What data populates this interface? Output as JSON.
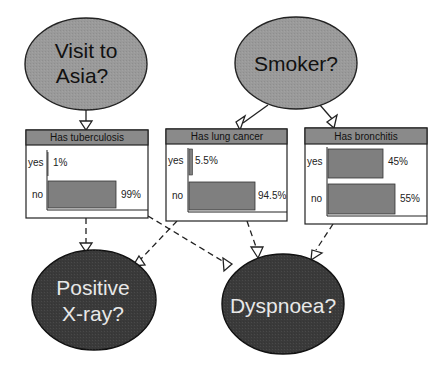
{
  "diagram": {
    "colors": {
      "background": "#ffffff",
      "root_node_fill": "#9a9a9a",
      "leaf_node_fill": "#3a3a3a",
      "box_header_fill": "#8a8a8a",
      "bar_fill": "#7f7f7f",
      "stroke": "#222222"
    },
    "root_nodes": [
      {
        "id": "asia",
        "line1": "Visit to",
        "line2": "Asia?"
      },
      {
        "id": "smoker",
        "line1": "Smoker?"
      }
    ],
    "intermediate_nodes": [
      {
        "id": "tuberculosis",
        "title": "Has tuberculosis",
        "states": [
          {
            "label": "yes",
            "value": "1%",
            "pct": 1
          },
          {
            "label": "no",
            "value": "99%",
            "pct": 99
          }
        ]
      },
      {
        "id": "lung_cancer",
        "title": "Has lung cancer",
        "states": [
          {
            "label": "yes",
            "value": "5.5%",
            "pct": 5.5
          },
          {
            "label": "no",
            "value": "94.5%",
            "pct": 94.5
          }
        ]
      },
      {
        "id": "bronchitis",
        "title": "Has bronchitis",
        "states": [
          {
            "label": "yes",
            "value": "45%",
            "pct": 45
          },
          {
            "label": "no",
            "value": "55%",
            "pct": 55
          }
        ]
      }
    ],
    "leaf_nodes": [
      {
        "id": "xray",
        "line1": "Positive",
        "line2": "X-ray?"
      },
      {
        "id": "dyspnoea",
        "line1": "Dyspnoea?"
      }
    ],
    "edges": [
      {
        "from": "asia",
        "to": "tuberculosis",
        "style": "solid"
      },
      {
        "from": "smoker",
        "to": "lung_cancer",
        "style": "solid"
      },
      {
        "from": "smoker",
        "to": "bronchitis",
        "style": "solid"
      },
      {
        "from": "tuberculosis",
        "to": "xray",
        "style": "dashed"
      },
      {
        "from": "tuberculosis",
        "to": "dyspnoea",
        "style": "dashed"
      },
      {
        "from": "lung_cancer",
        "to": "xray",
        "style": "dashed"
      },
      {
        "from": "lung_cancer",
        "to": "dyspnoea",
        "style": "dashed"
      },
      {
        "from": "bronchitis",
        "to": "dyspnoea",
        "style": "dashed"
      }
    ]
  }
}
